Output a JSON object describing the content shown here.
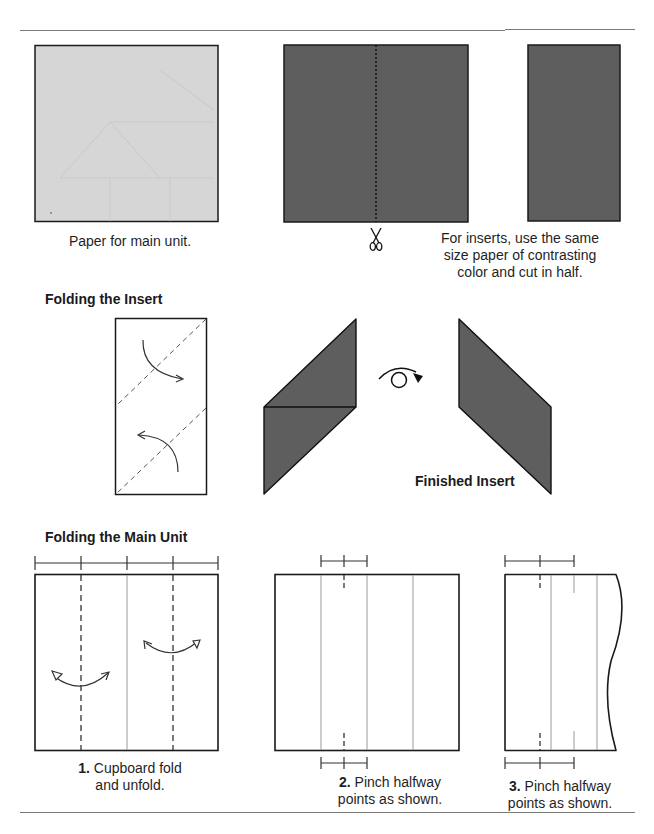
{
  "colors": {
    "main_paper": "#d6d6d6",
    "insert_paper": "#5e5e5e",
    "line": "#1a1a1a",
    "crease": "#9a9a9a",
    "rule": "#7a7a7a"
  },
  "section_prep": {
    "main_paper_caption": "Paper for main unit.",
    "insert_caption_line1": "For inserts, use the same",
    "insert_caption_line2": "size paper of contrasting",
    "insert_caption_line3": "color and cut in half.",
    "icons": [
      "scissors-icon"
    ]
  },
  "section_insert": {
    "heading": "Folding the Insert",
    "finished_label": "Finished Insert",
    "icons": [
      "fold-arrow-icon",
      "turn-over-icon"
    ]
  },
  "section_main_unit": {
    "heading": "Folding the Main Unit",
    "steps": [
      {
        "number": "1.",
        "line1": "Cupboard fold",
        "line2": "and unfold."
      },
      {
        "number": "2.",
        "line1": "Pinch halfway",
        "line2": "points as shown."
      },
      {
        "number": "3.",
        "line1": "Pinch halfway",
        "line2": "points as shown."
      }
    ]
  }
}
